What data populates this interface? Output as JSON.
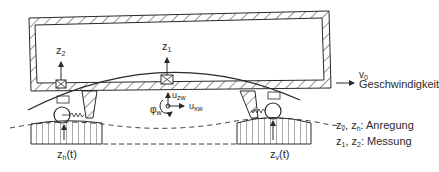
{
  "diagram": {
    "type": "vehicle-body-measurement-schematic",
    "sensors": {
      "z1": {
        "main": "z",
        "sub": "1"
      },
      "z2": {
        "main": "z",
        "sub": "2"
      }
    },
    "wheelset_coords": {
      "u_zw": {
        "main": "u",
        "sub": "zw"
      },
      "u_xw": {
        "main": "u",
        "sub": "xw"
      },
      "phi_w": {
        "main": "φ",
        "sub": "w"
      }
    },
    "velocity": {
      "main": "v",
      "sub": "0",
      "label": "Geschwindigkeit"
    },
    "excitations": {
      "rear": {
        "main": "z",
        "sub": "h",
        "suffix": "(t)"
      },
      "front": {
        "main": "z",
        "sub": "v",
        "suffix": "(t)"
      }
    },
    "legend": [
      {
        "vars": [
          {
            "main": "z",
            "sub": "v"
          },
          {
            "main": "z",
            "sub": "h"
          }
        ],
        "label": ": Anregung"
      },
      {
        "vars": [
          {
            "main": "z",
            "sub": "1"
          },
          {
            "main": "z",
            "sub": "2"
          }
        ],
        "label": ": Messung"
      }
    ],
    "colors": {
      "line": "#2a2a2a",
      "background": "#ffffff"
    }
  }
}
